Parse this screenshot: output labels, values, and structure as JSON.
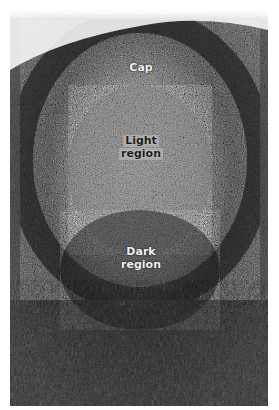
{
  "figure": {
    "colors": {
      "background": "#ffffff",
      "tissue_dark": "#1e1e1e",
      "tissue_mid": "#6e6e6e",
      "tissue_light": "#bdbdbd"
    },
    "labels": {
      "cap": "Cap",
      "light_region_line1": "Light",
      "light_region_line2": "region",
      "dark_region_line1": "Dark",
      "dark_region_line2": "region"
    }
  }
}
